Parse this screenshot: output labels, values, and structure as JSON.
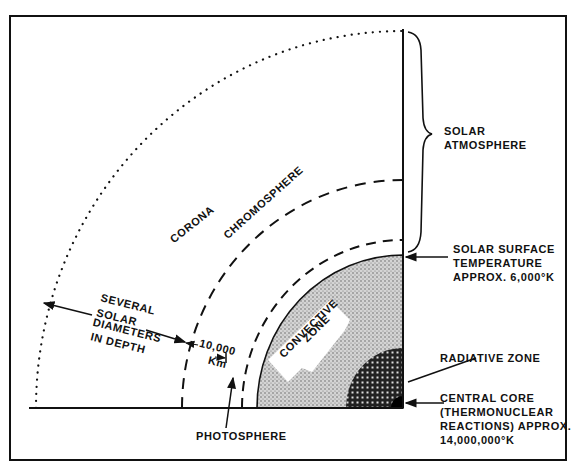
{
  "diagram": {
    "type": "solar-structure-quadrant",
    "regions": {
      "corona": "CORONA",
      "chromosphere": "CHROMOSPHERE",
      "convective_zone_line1": "CONVECTIVE",
      "convective_zone_line2": "ZONE"
    },
    "annotations": {
      "solar_atmosphere_line1": "SOLAR",
      "solar_atmosphere_line2": "ATMOSPHERE",
      "surface_temp_line1": "SOLAR SURFACE",
      "surface_temp_line2": "TEMPERATURE",
      "surface_temp_line3": "APPROX. 6,000°K",
      "radiative_zone": "RADIATIVE ZONE",
      "core_line1": "CENTRAL CORE",
      "core_line2": "(THERMONUCLEAR",
      "core_line3": "REACTIONS) APPROX.",
      "core_line4": "14,000,000°K",
      "photosphere": "PHOTOSPHERE",
      "corona_depth_line1": "SEVERAL",
      "corona_depth_line2": "SOLAR",
      "corona_depth_line3": "DIAMETERS",
      "corona_depth_line4": "IN DEPTH",
      "chromosphere_depth_line1": "10,000",
      "chromosphere_depth_line2": "Km"
    },
    "colors": {
      "ink": "#111111",
      "background": "#ffffff",
      "stipple": "#9a9a9a"
    }
  }
}
